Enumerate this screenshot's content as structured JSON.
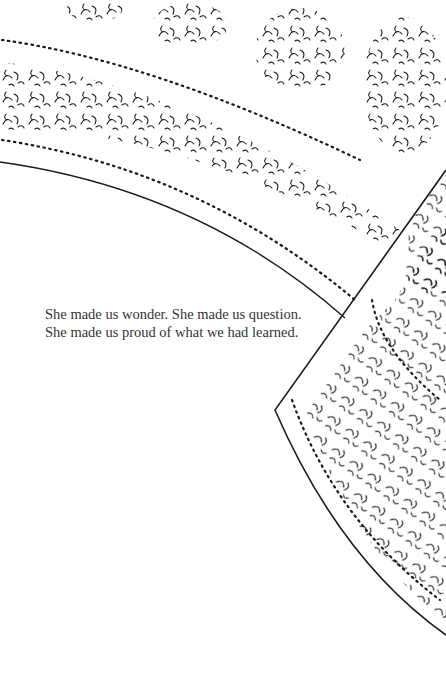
{
  "page": {
    "caption_lines": [
      "She made us wonder. She made us question.",
      "She made us proud of what we had learned."
    ]
  },
  "illustration": {
    "description": "black-and-white line drawing of ornate paisley-patterned fabric/sari with beaded borders",
    "ink_color": "#1a1a1a",
    "background_color": "#ffffff"
  }
}
